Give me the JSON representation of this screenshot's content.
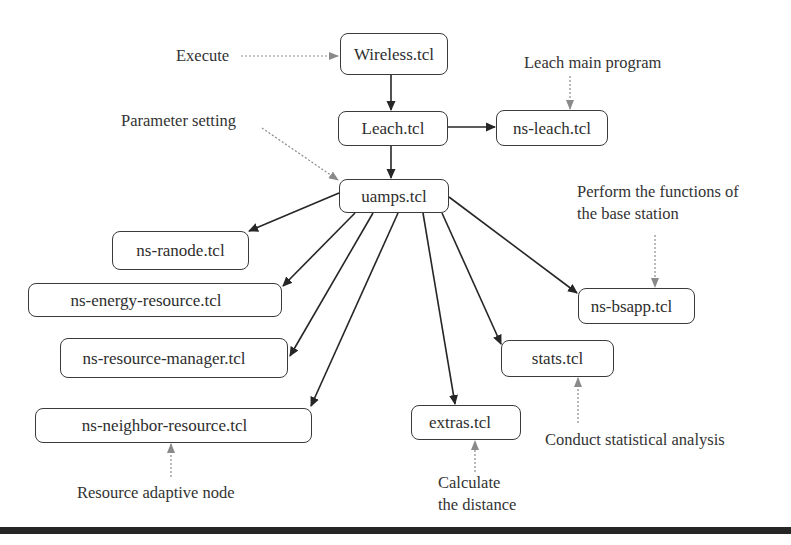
{
  "diagram": {
    "nodes": {
      "wireless": "Wireless.tcl",
      "leach": "Leach.tcl",
      "ns_leach": "ns-leach.tcl",
      "uamps": "uamps.tcl",
      "ns_ranode": "ns-ranode.tcl",
      "ns_energy_resource": "ns-energy-resource.tcl",
      "ns_resource_manager": "ns-resource-manager.tcl",
      "ns_neighbor_resource": "ns-neighbor-resource.tcl",
      "extras": "extras.tcl",
      "stats": "stats.tcl",
      "ns_bsapp": "ns-bsapp.tcl"
    },
    "annotations": {
      "execute": "Execute",
      "parameter_setting": "Parameter setting",
      "leach_main_program": "Leach main program",
      "base_station_line1": "Perform the functions of",
      "base_station_line2": "the base station",
      "statistical_analysis": "Conduct statistical analysis",
      "calculate_line1": "Calculate",
      "calculate_line2": "the distance",
      "resource_adaptive_node": "Resource adaptive node"
    },
    "edges": [
      {
        "from": "Wireless.tcl",
        "to": "Leach.tcl",
        "style": "solid"
      },
      {
        "from": "Leach.tcl",
        "to": "uamps.tcl",
        "style": "solid"
      },
      {
        "from": "Leach.tcl",
        "to": "ns-leach.tcl",
        "style": "solid"
      },
      {
        "from": "uamps.tcl",
        "to": "ns-ranode.tcl",
        "style": "solid"
      },
      {
        "from": "uamps.tcl",
        "to": "ns-energy-resource.tcl",
        "style": "solid"
      },
      {
        "from": "uamps.tcl",
        "to": "ns-resource-manager.tcl",
        "style": "solid"
      },
      {
        "from": "uamps.tcl",
        "to": "ns-neighbor-resource.tcl",
        "style": "solid"
      },
      {
        "from": "uamps.tcl",
        "to": "extras.tcl",
        "style": "solid"
      },
      {
        "from": "uamps.tcl",
        "to": "stats.tcl",
        "style": "solid"
      },
      {
        "from": "uamps.tcl",
        "to": "ns-bsapp.tcl",
        "style": "solid"
      },
      {
        "from": "Execute",
        "to": "Wireless.tcl",
        "style": "dotted"
      },
      {
        "from": "Parameter setting",
        "to": "uamps.tcl",
        "style": "dotted"
      },
      {
        "from": "Leach main program",
        "to": "ns-leach.tcl",
        "style": "dotted"
      },
      {
        "from": "Perform the functions of the base station",
        "to": "ns-bsapp.tcl",
        "style": "dotted"
      },
      {
        "from": "Conduct statistical analysis",
        "to": "stats.tcl",
        "style": "dotted"
      },
      {
        "from": "Calculate the distance",
        "to": "extras.tcl",
        "style": "dotted"
      },
      {
        "from": "Resource adaptive node",
        "to": "ns-neighbor-resource.tcl",
        "style": "dotted"
      }
    ],
    "colors": {
      "solid_edge": "#262626",
      "dotted_edge": "#8a8a8a",
      "node_border": "#3a3a3a",
      "text": "#333333"
    }
  }
}
